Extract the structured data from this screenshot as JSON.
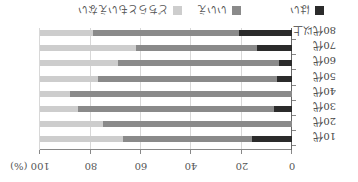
{
  "chart_data": {
    "type": "bar",
    "orientation": "horizontal",
    "stacked": true,
    "rendered_rotation_deg": 180,
    "title": "",
    "xlabel": "(%)",
    "ylabel": "",
    "xlim": [
      0,
      100
    ],
    "x_ticks": [
      "0",
      "20",
      "40",
      "60",
      "80",
      "100 (%)"
    ],
    "categories": [
      "10代",
      "20代",
      "30代",
      "40代",
      "50代",
      "60代",
      "70代",
      "80代以上"
    ],
    "series": [
      {
        "name": "はい",
        "color": "#2b2b2b",
        "values": [
          16,
          0,
          7,
          0,
          6,
          5,
          14,
          21
        ]
      },
      {
        "name": "いいえ",
        "color": "#8a8a8a",
        "values": [
          51,
          75,
          78,
          88,
          71,
          64,
          48,
          58
        ]
      },
      {
        "name": "どちらともいえない",
        "color": "#cdcdcd",
        "values": [
          33,
          25,
          15,
          12,
          23,
          31,
          38,
          21
        ]
      }
    ],
    "legend_position": "top",
    "grid": true
  }
}
